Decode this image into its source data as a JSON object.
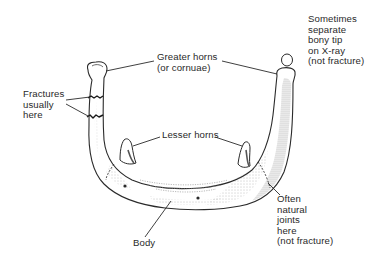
{
  "diagram": {
    "colors": {
      "background": "#ffffff",
      "ink": "#2a2a2a",
      "shading": "#7a7a7a"
    },
    "labels": {
      "greater_horns": {
        "lines": [
          "Greater horns",
          "(or cornuae)"
        ]
      },
      "fractures": {
        "lines": [
          "Fractures",
          "usually",
          "here"
        ]
      },
      "bony_tip": {
        "lines": [
          "Sometimes",
          "separate",
          "bony tip",
          "on X-ray",
          "(not fracture)"
        ]
      },
      "lesser_horns": {
        "lines": [
          "Lesser horns"
        ]
      },
      "natural_joints": {
        "lines": [
          "Often",
          "natural",
          "joints",
          "here",
          "(not fracture)"
        ]
      },
      "body": {
        "lines": [
          "Body"
        ]
      }
    }
  }
}
